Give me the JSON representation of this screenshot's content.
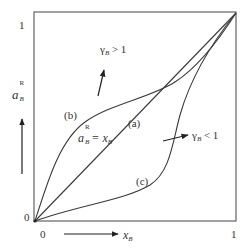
{
  "diagram": {
    "title": "",
    "axes": {
      "x": {
        "label_main": "x",
        "label_sub": "B",
        "tick_min": "0",
        "tick_max": "1"
      },
      "y": {
        "label_main": "a",
        "label_sub": "B",
        "label_sup": "R",
        "tick_min": "0",
        "tick_max": "1"
      }
    },
    "curves": [
      {
        "id": "a",
        "label": "(a)",
        "description": "ideal line",
        "equation_lhs_main": "a",
        "equation_lhs_sub": "B",
        "equation_lhs_sup": "R",
        "equation_rhs": "= x",
        "equation_rhs_sub": "B"
      },
      {
        "id": "b",
        "label": "(b)",
        "description": "positive deviation, concave",
        "annotation_main": "γ",
        "annotation_sub": "B",
        "annotation_rel": " > 1"
      },
      {
        "id": "c",
        "label": "(c)",
        "description": "negative deviation, convex",
        "annotation_main": "γ",
        "annotation_sub": "B",
        "annotation_rel": " < 1"
      }
    ],
    "colors": {
      "line": "#3a3a3a",
      "frame": "#555555",
      "background": "#ffffff"
    }
  }
}
